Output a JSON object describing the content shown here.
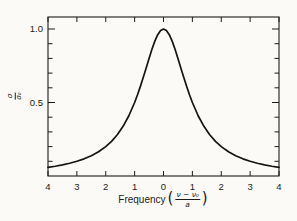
{
  "figure": {
    "kind": "scanned-textbook-plot",
    "background_color": "#fbfaf7",
    "ink_color": "#1c1c1c",
    "curve_color": "#141414"
  },
  "labels": {
    "x_title": "Frequency",
    "x_frac_num": "ν − ν₀",
    "x_frac_den": "a",
    "y_frac_num": "σ",
    "y_frac_den": "σ₀",
    "open_paren": "(",
    "close_paren": ")"
  },
  "chart_data": {
    "type": "line",
    "title": "",
    "xlabel": "Frequency ((ν − ν₀)/a)",
    "ylabel": "σ/σ₀",
    "xlim": [
      -4,
      4
    ],
    "ylim": [
      0,
      1.08
    ],
    "grid": false,
    "legend": "none",
    "frame": "box with inward ticks on all four sides",
    "x_ticks": [
      -4,
      -3,
      -2,
      -1,
      0,
      1,
      2,
      3,
      4
    ],
    "x_tick_labels": [
      "4",
      "3",
      "2",
      "1",
      "0",
      "1",
      "2",
      "3",
      "4"
    ],
    "y_ticks": [
      0.1,
      0.2,
      0.3,
      0.4,
      0.5,
      0.6,
      0.7,
      0.8,
      0.9,
      1.0
    ],
    "y_labeled_ticks": [
      {
        "value": 0.5,
        "label": "0.5"
      },
      {
        "value": 1.0,
        "label": "1.0"
      }
    ],
    "series": [
      {
        "name": "lorentzian-lineshape",
        "function": "y = 1 / (1 + x^2)",
        "peak": {
          "x": 0,
          "y": 1.0
        },
        "points": [
          [
            -4,
            0.0588
          ],
          [
            -3.75,
            0.0664
          ],
          [
            -3.5,
            0.0755
          ],
          [
            -3.25,
            0.0865
          ],
          [
            -3,
            0.1
          ],
          [
            -2.75,
            0.1168
          ],
          [
            -2.5,
            0.1379
          ],
          [
            -2.25,
            0.1649
          ],
          [
            -2,
            0.2
          ],
          [
            -1.8,
            0.2358
          ],
          [
            -1.6,
            0.2809
          ],
          [
            -1.4,
            0.3378
          ],
          [
            -1.2,
            0.4098
          ],
          [
            -1,
            0.5
          ],
          [
            -0.9,
            0.5525
          ],
          [
            -0.8,
            0.6098
          ],
          [
            -0.7,
            0.6711
          ],
          [
            -0.6,
            0.7353
          ],
          [
            -0.5,
            0.8
          ],
          [
            -0.4,
            0.8621
          ],
          [
            -0.3,
            0.9174
          ],
          [
            -0.2,
            0.9615
          ],
          [
            -0.1,
            0.9901
          ],
          [
            0,
            1.0
          ],
          [
            0.1,
            0.9901
          ],
          [
            0.2,
            0.9615
          ],
          [
            0.3,
            0.9174
          ],
          [
            0.4,
            0.8621
          ],
          [
            0.5,
            0.8
          ],
          [
            0.6,
            0.7353
          ],
          [
            0.7,
            0.6711
          ],
          [
            0.8,
            0.6098
          ],
          [
            0.9,
            0.5525
          ],
          [
            1,
            0.5
          ],
          [
            1.2,
            0.4098
          ],
          [
            1.4,
            0.3378
          ],
          [
            1.6,
            0.2809
          ],
          [
            1.8,
            0.2358
          ],
          [
            2,
            0.2
          ],
          [
            2.25,
            0.1649
          ],
          [
            2.5,
            0.1379
          ],
          [
            2.75,
            0.1168
          ],
          [
            3,
            0.1
          ],
          [
            3.25,
            0.0865
          ],
          [
            3.5,
            0.0755
          ],
          [
            3.75,
            0.0664
          ],
          [
            4,
            0.0588
          ]
        ]
      }
    ]
  }
}
